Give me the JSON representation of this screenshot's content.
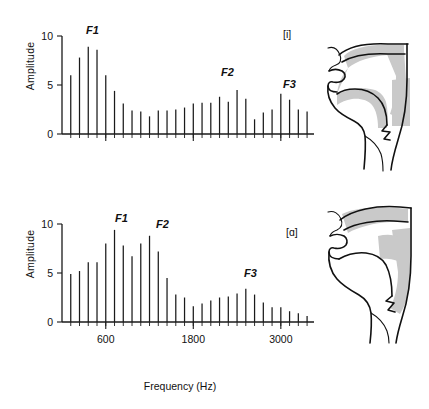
{
  "figure": {
    "xaxis_title": "Frequency (Hz)",
    "yaxis_title": "Amplitude"
  },
  "panels": [
    {
      "id": "top",
      "phoneme_tag": "[i]",
      "diagram_name": "vocal-tract-diagram-i",
      "formants": [
        {
          "label": "F1",
          "x_px": 86,
          "y_px": 16
        },
        {
          "label": "F2",
          "x_px": 221,
          "y_px": 58
        },
        {
          "label": "F3",
          "x_px": 283,
          "y_px": 70
        }
      ]
    },
    {
      "id": "bottom",
      "phoneme_tag": "[ɑ]",
      "diagram_name": "vocal-tract-diagram-a",
      "formants": [
        {
          "label": "F1",
          "x_px": 115,
          "y_px": 16
        },
        {
          "label": "F2",
          "x_px": 156,
          "y_px": 22
        },
        {
          "label": "F3",
          "x_px": 244,
          "y_px": 71
        }
      ]
    }
  ],
  "chart_data": [
    {
      "type": "bar",
      "title": "[i] vowel harmonic spectrum",
      "subtitle": "",
      "xlabel": "Frequency (Hz)",
      "ylabel": "Amplitude",
      "ylim": [
        0,
        10
      ],
      "xlim": [
        0,
        3400
      ],
      "yticks": [
        0,
        5,
        10
      ],
      "ytick_labels": [
        "0",
        "5",
        "10"
      ],
      "xticks": [
        600,
        1800,
        3000
      ],
      "xtick_labels": [
        "600",
        "1800",
        "3000"
      ],
      "grid": false,
      "legend": "none",
      "annotations": [
        "F1",
        "F2",
        "F3",
        "[i]"
      ],
      "harmonic_spacing_hz": 120,
      "x": [
        120,
        240,
        360,
        480,
        600,
        720,
        840,
        960,
        1080,
        1200,
        1320,
        1440,
        1560,
        1680,
        1800,
        1920,
        2040,
        2160,
        2280,
        2400,
        2520,
        2640,
        2760,
        2880,
        3000,
        3120,
        3240,
        3360
      ],
      "values": [
        6.0,
        7.8,
        8.9,
        8.6,
        6.0,
        4.4,
        3.1,
        2.4,
        2.3,
        1.8,
        2.4,
        2.4,
        2.5,
        2.7,
        3.1,
        3.2,
        3.2,
        3.8,
        3.3,
        4.5,
        3.6,
        1.5,
        2.2,
        2.5,
        4.1,
        3.5,
        2.5,
        2.3
      ]
    },
    {
      "type": "bar",
      "title": "[ɑ] vowel harmonic spectrum",
      "subtitle": "",
      "xlabel": "Frequency (Hz)",
      "ylabel": "Amplitude",
      "ylim": [
        0,
        10
      ],
      "xlim": [
        0,
        3400
      ],
      "yticks": [
        0,
        5,
        10
      ],
      "ytick_labels": [
        "0",
        "5",
        "10"
      ],
      "xticks": [
        600,
        1800,
        3000
      ],
      "xtick_labels": [
        "600",
        "1800",
        "3000"
      ],
      "grid": false,
      "legend": "none",
      "annotations": [
        "F1",
        "F2",
        "F3",
        "[ɑ]"
      ],
      "harmonic_spacing_hz": 120,
      "x": [
        120,
        240,
        360,
        480,
        600,
        720,
        840,
        960,
        1080,
        1200,
        1320,
        1440,
        1560,
        1680,
        1800,
        1920,
        2040,
        2160,
        2280,
        2400,
        2520,
        2640,
        2760,
        2880,
        3000,
        3120,
        3240,
        3360
      ],
      "values": [
        4.9,
        5.2,
        6.1,
        6.1,
        8.0,
        9.4,
        7.8,
        6.7,
        8.0,
        8.8,
        7.2,
        4.5,
        2.8,
        2.5,
        1.6,
        1.9,
        2.2,
        2.5,
        2.6,
        2.9,
        3.4,
        2.8,
        2.0,
        1.5,
        1.5,
        1.1,
        0.9,
        0.6
      ]
    }
  ]
}
